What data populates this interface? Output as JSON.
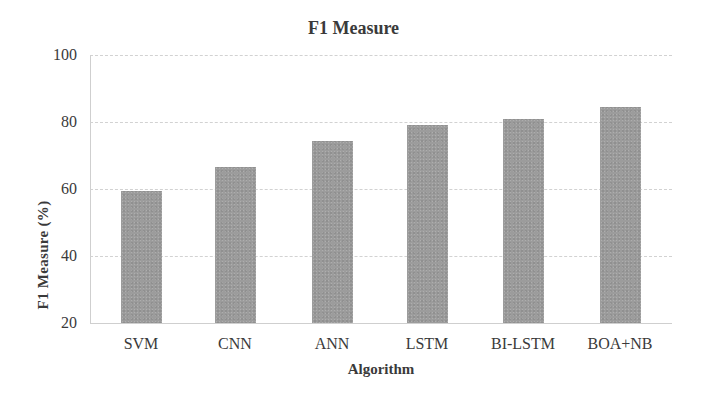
{
  "chart_data": {
    "type": "bar",
    "title": "F1 Measure",
    "xlabel": "Algorithm",
    "ylabel": "F1 Measure (%)",
    "categories": [
      "SVM",
      "CNN",
      "ANN",
      "LSTM",
      "BI-LSTM",
      "BOA+NB"
    ],
    "values": [
      59.5,
      66.5,
      74.3,
      79.0,
      81.0,
      84.5
    ],
    "ylim": [
      20,
      100
    ],
    "yticks": [
      20,
      40,
      60,
      80,
      100
    ],
    "grid": true,
    "legend": null,
    "bar_color": "#9c9c9c"
  }
}
